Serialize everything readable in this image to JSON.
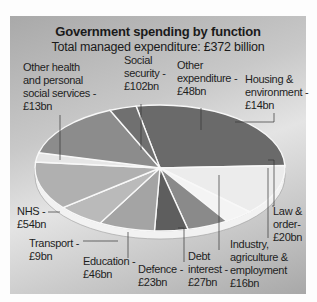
{
  "chart_data": {
    "type": "pie",
    "title": "Government spending by function",
    "subtitle": "Total managed expenditure: £372 billion",
    "unit": "£bn",
    "total": 372,
    "categories": [
      "Social security",
      "Other expenditure",
      "Housing & environment",
      "Law & order",
      "Industry, agriculture & employment",
      "Debt interest",
      "Defence",
      "Education",
      "Transport",
      "NHS",
      "Other health and personal social services"
    ],
    "values": [
      102,
      48,
      14,
      20,
      16,
      27,
      23,
      46,
      9,
      54,
      13
    ],
    "labels": [
      "Social\nsecurity -\n£102bn",
      "Other\nexpenditure -\n£48bn",
      "Housing &\nenvironment -\n£14bn",
      "Law &\norder-\n£20bn",
      "Industry,\nagriculture &\nemployment\n£16bn",
      "Debt\ninterest -\n£27bn",
      "Defence -\n£23bn",
      "Education -\n£46bn",
      "Transport -\n£9bn",
      "NHS -\n£54bn",
      "Other health\nand personal\nsocial services -\n£13bn"
    ],
    "colors": [
      "#6a6a6a",
      "#ececec",
      "#f4f4f4",
      "#8a8a8a",
      "#5e5e5e",
      "#a4a4a4",
      "#bababa",
      "#b0b0b0",
      "#e6e6e6",
      "#8c8c8c",
      "#707070"
    ],
    "legend": "none",
    "style": "3d-tilted"
  },
  "header": {
    "title": "Government spending by function",
    "subtitle": "Total managed expenditure: £372 billion"
  }
}
